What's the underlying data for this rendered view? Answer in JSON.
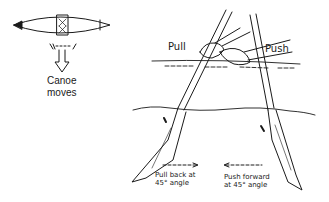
{
  "diagram": {
    "canoe_inset": {
      "caption_line1": "Canoe",
      "caption_line2": "moves"
    },
    "labels": {
      "pull": "Pull",
      "push": "Push",
      "pull_note_line1": "Pull back at",
      "pull_note_line2": "45° angle",
      "push_note_line1": "Push forward",
      "push_note_line2": "at 45° angle"
    },
    "colors": {
      "ink": "#1a1a1a",
      "background": "#ffffff"
    }
  }
}
